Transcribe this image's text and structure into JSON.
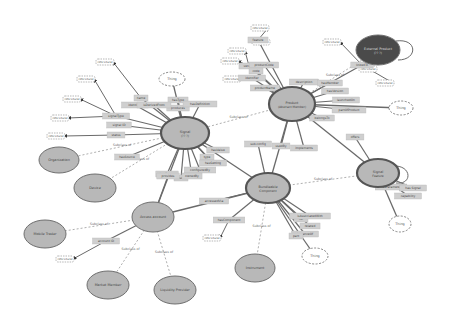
{
  "colors": {
    "class_fill": "#b8b8b8",
    "class_stroke": "#6f6f6f",
    "class_stroke_main": "#555555",
    "external_fill": "#4a4a4a",
    "literal_fill": "#cfcfcf",
    "edge": "#6a6a6a",
    "subclass_edge": "#9a9a9a",
    "thing_stroke": "#777777",
    "datatype_fill": "#e6e6e6"
  },
  "nodes": [
    {
      "id": "signal",
      "type": "class",
      "label": "Signal",
      "sub": "(?? ?)",
      "x": 185,
      "y": 133,
      "rx": 24,
      "ry": 16,
      "main": true
    },
    {
      "id": "product",
      "type": "class",
      "label": "Product",
      "sub": "(Abstract Member)",
      "x": 292,
      "y": 104,
      "rx": 23,
      "ry": 17,
      "main": true
    },
    {
      "id": "bundle",
      "type": "class",
      "label": "Bundleable",
      "sub": "Component",
      "x": 268,
      "y": 188,
      "rx": 22,
      "ry": 15,
      "main": true
    },
    {
      "id": "feature",
      "type": "class",
      "label": "Signal",
      "sub": "Feature",
      "x": 378,
      "y": 173,
      "rx": 21,
      "ry": 14,
      "main": true
    },
    {
      "id": "access",
      "type": "class",
      "label": "Access account",
      "sub": "",
      "x": 153,
      "y": 217,
      "rx": 21,
      "ry": 15,
      "main": false
    },
    {
      "id": "external",
      "type": "external",
      "label": "External Product",
      "sub": "(?? ?)",
      "x": 378,
      "y": 50,
      "rx": 22,
      "ry": 15,
      "main": false
    },
    {
      "id": "organization",
      "type": "class",
      "label": "Organization",
      "sub": "",
      "x": 59,
      "y": 160,
      "rx": 20,
      "ry": 13,
      "main": false
    },
    {
      "id": "device",
      "type": "class",
      "label": "Device",
      "sub": "",
      "x": 95,
      "y": 188,
      "rx": 21,
      "ry": 14,
      "main": false
    },
    {
      "id": "mobile",
      "type": "class",
      "label": "Mobile Trader",
      "sub": "",
      "x": 45,
      "y": 234,
      "rx": 21,
      "ry": 14,
      "main": false
    },
    {
      "id": "market",
      "type": "class",
      "label": "Market Member",
      "sub": "",
      "x": 108,
      "y": 285,
      "rx": 21,
      "ry": 14,
      "main": false
    },
    {
      "id": "liquidity",
      "type": "class",
      "label": "Liquidity Provider",
      "sub": "",
      "x": 175,
      "y": 290,
      "rx": 21,
      "ry": 14,
      "main": false
    },
    {
      "id": "instrument",
      "type": "class",
      "label": "Instrument",
      "sub": "",
      "x": 255,
      "y": 268,
      "rx": 20,
      "ry": 14,
      "main": false
    },
    {
      "id": "thing1",
      "type": "thing",
      "label": "Thing",
      "x": 172,
      "y": 79,
      "rx": 13,
      "ry": 7
    },
    {
      "id": "thing2",
      "type": "thing",
      "label": "Thing",
      "x": 401,
      "y": 108,
      "rx": 12,
      "ry": 7
    },
    {
      "id": "thing3",
      "type": "thing",
      "label": "Thing",
      "x": 315,
      "y": 256,
      "rx": 13,
      "ry": 8
    },
    {
      "id": "thing4",
      "type": "thing",
      "label": "Thing",
      "x": 400,
      "y": 224,
      "rx": 11,
      "ry": 8
    }
  ],
  "datatypes": [
    {
      "label": "rdfs:Literal",
      "x": 105,
      "y": 62
    },
    {
      "label": "rdfs:Literal",
      "x": 86,
      "y": 79
    },
    {
      "label": "rdfs:Literal",
      "x": 72,
      "y": 99
    },
    {
      "label": "rdfs:Literal",
      "x": 60,
      "y": 118
    },
    {
      "label": "rdfs:Literal",
      "x": 56,
      "y": 136
    },
    {
      "label": "rdfs:Literal",
      "x": 261,
      "y": 42
    },
    {
      "label": "rdfs:Literal",
      "x": 237,
      "y": 51
    },
    {
      "label": "rdfs:Literal",
      "x": 260,
      "y": 28
    },
    {
      "label": "rdfs:Literal",
      "x": 230,
      "y": 61
    },
    {
      "label": "rdfs:Literal",
      "x": 232,
      "y": 79
    },
    {
      "label": "rdfs:Literal",
      "x": 332,
      "y": 42
    },
    {
      "label": "rdfs:Literal",
      "x": 368,
      "y": 69
    },
    {
      "label": "rdfs:Literal",
      "x": 385,
      "y": 83
    },
    {
      "label": "rdfs:Literal",
      "x": 212,
      "y": 238
    },
    {
      "label": "rdfs:Literal",
      "x": 65,
      "y": 259
    }
  ],
  "properties": [
    {
      "label": "name",
      "x": 141,
      "y": 98
    },
    {
      "label": "identifier",
      "x": 135,
      "y": 105
    },
    {
      "label": "signalType",
      "x": 116,
      "y": 116
    },
    {
      "label": "signal ID",
      "x": 119,
      "y": 125
    },
    {
      "label": "status",
      "x": 116,
      "y": 135
    },
    {
      "label": "hasType",
      "x": 178,
      "y": 100
    },
    {
      "label": "produces",
      "x": 178,
      "y": 108
    },
    {
      "label": "hasDefinition",
      "x": 200,
      "y": 104
    },
    {
      "label": "isDerivedFrom",
      "x": 154,
      "y": 105
    },
    {
      "label": "hasSource",
      "x": 127,
      "y": 157
    },
    {
      "label": "hasScope",
      "x": 167,
      "y": 174
    },
    {
      "label": "uses",
      "x": 181,
      "y": 178
    },
    {
      "label": "hasValue",
      "x": 218,
      "y": 150
    },
    {
      "label": "type",
      "x": 207,
      "y": 157
    },
    {
      "label": "hasSetting",
      "x": 213,
      "y": 163
    },
    {
      "label": "configuredBy",
      "x": 200,
      "y": 170
    },
    {
      "label": "feature",
      "x": 258,
      "y": 40
    },
    {
      "label": "version",
      "x": 249,
      "y": 66
    },
    {
      "label": "productCode",
      "x": 264,
      "y": 65
    },
    {
      "label": "code",
      "x": 256,
      "y": 71
    },
    {
      "label": "identifier",
      "x": 252,
      "y": 78
    },
    {
      "label": "productName",
      "x": 265,
      "y": 88
    },
    {
      "label": "description",
      "x": 304,
      "y": 82
    },
    {
      "label": "hasMember",
      "x": 330,
      "y": 83
    },
    {
      "label": "hasVersion",
      "x": 335,
      "y": 91
    },
    {
      "label": "launchedOn",
      "x": 346,
      "y": 100
    },
    {
      "label": "partOfProduct",
      "x": 349,
      "y": 110
    },
    {
      "label": "belongsTo",
      "x": 322,
      "y": 118
    },
    {
      "label": "offers",
      "x": 355,
      "y": 137
    },
    {
      "label": "linkedTo",
      "x": 362,
      "y": 65
    },
    {
      "label": "sub-config",
      "x": 258,
      "y": 144
    },
    {
      "label": "usedBy",
      "x": 281,
      "y": 146
    },
    {
      "label": "implements",
      "x": 304,
      "y": 148
    },
    {
      "label": "accessedVia",
      "x": 214,
      "y": 201
    },
    {
      "label": "hasComponent",
      "x": 229,
      "y": 220
    },
    {
      "label": "rel",
      "x": 301,
      "y": 219
    },
    {
      "label": "isAssociatedWith",
      "x": 310,
      "y": 216
    },
    {
      "label": "related",
      "x": 310,
      "y": 226
    },
    {
      "label": "instanceOf",
      "x": 305,
      "y": 234
    },
    {
      "label": "part",
      "x": 296,
      "y": 236
    },
    {
      "label": "hasParameter",
      "x": 391,
      "y": 187
    },
    {
      "label": "capability",
      "x": 408,
      "y": 196
    },
    {
      "label": "has Signal",
      "x": 413,
      "y": 188
    },
    {
      "label": "account ID",
      "x": 106,
      "y": 241
    },
    {
      "label": "provides",
      "x": 168,
      "y": 176
    },
    {
      "label": "ownedBy",
      "x": 192,
      "y": 176
    }
  ],
  "subclass_label": "Subclass of",
  "edges_subclass": [
    [
      "organization",
      "signal"
    ],
    [
      "device",
      "signal"
    ],
    [
      "mobile",
      "access"
    ],
    [
      "market",
      "access"
    ],
    [
      "liquidity",
      "access"
    ],
    [
      "instrument",
      "bundle"
    ],
    [
      "feature",
      "bundle"
    ],
    [
      "signal",
      "product"
    ],
    [
      "product",
      "external"
    ]
  ],
  "edges_object": [
    [
      "signal",
      "bundle"
    ],
    [
      "product",
      "bundle"
    ],
    [
      "access",
      "bundle"
    ],
    [
      "product",
      "feature"
    ],
    [
      "signal",
      "access"
    ],
    [
      "feature",
      "thing4"
    ],
    [
      "bundle",
      "thing3"
    ],
    [
      "product",
      "thing2"
    ],
    [
      "signal",
      "thing1"
    ]
  ]
}
